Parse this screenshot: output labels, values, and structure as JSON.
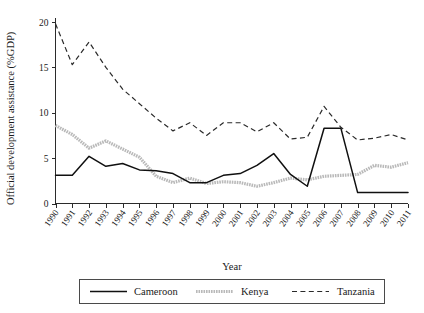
{
  "chart_data": {
    "type": "line",
    "title": "",
    "xlabel": "Year",
    "ylabel": "Official development assistance (%GDP)",
    "x": [
      1990,
      1991,
      1992,
      1993,
      1994,
      1995,
      1996,
      1997,
      1998,
      1999,
      2000,
      2001,
      2002,
      2003,
      2004,
      2005,
      2006,
      2007,
      2008,
      2009,
      2010,
      2011
    ],
    "xtick_labels": [
      "1990",
      "1991",
      "1992",
      "1993",
      "1994",
      "1995",
      "1996",
      "1997",
      "1998",
      "1999",
      "2000",
      "2001",
      "2002",
      "2003",
      "2004",
      "2005",
      "2006",
      "2007",
      "2008",
      "2009",
      "2010",
      "2011"
    ],
    "ytick_labels": [
      "0",
      "5",
      "10",
      "15",
      "20"
    ],
    "yticks": [
      0,
      5,
      10,
      15,
      20
    ],
    "ylim": [
      0,
      21
    ],
    "xlim": [
      1990,
      2011
    ],
    "grid": false,
    "legend_position": "below-axes",
    "series": [
      {
        "name": "Cameroon",
        "style": "solid",
        "color": "#101010",
        "values": [
          3.1,
          3.1,
          5.2,
          4.1,
          4.4,
          3.7,
          3.6,
          3.3,
          2.3,
          2.3,
          3.1,
          3.3,
          4.2,
          5.5,
          3.2,
          1.9,
          8.3,
          8.3,
          1.2,
          1.2,
          1.2,
          1.2
        ]
      },
      {
        "name": "Kenya",
        "style": "thick-dotted",
        "color": "#b9b9b9",
        "values": [
          8.6,
          7.6,
          6.1,
          6.9,
          6.0,
          5.1,
          3.0,
          2.3,
          2.8,
          2.2,
          2.4,
          2.3,
          1.9,
          2.3,
          2.8,
          2.6,
          3.0,
          3.1,
          3.2,
          4.2,
          4.0,
          4.5
        ]
      },
      {
        "name": "Tanzania",
        "style": "dashed",
        "color": "#2a2a2a",
        "values": [
          19.8,
          15.3,
          17.8,
          15.0,
          12.6,
          11.0,
          9.4,
          8.0,
          8.9,
          7.5,
          8.9,
          8.9,
          7.9,
          8.9,
          7.1,
          7.3,
          10.7,
          8.4,
          7.0,
          7.2,
          7.6,
          7.0
        ]
      }
    ]
  },
  "legend": {
    "items": [
      {
        "label": "Cameroon"
      },
      {
        "label": "Kenya"
      },
      {
        "label": "Tanzania"
      }
    ]
  }
}
